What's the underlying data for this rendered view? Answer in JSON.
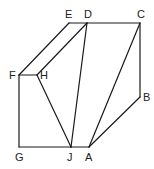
{
  "diagram": {
    "type": "geometric-figure",
    "stroke_color": "#1a1a1a",
    "label_color": "#222222",
    "vertices": [
      {
        "id": "E",
        "label": "E",
        "x": 69,
        "y": 23,
        "lx": 65,
        "ly": 18
      },
      {
        "id": "D",
        "label": "D",
        "x": 87,
        "y": 23,
        "lx": 84,
        "ly": 18
      },
      {
        "id": "C",
        "label": "C",
        "x": 140,
        "y": 23,
        "lx": 137,
        "ly": 18
      },
      {
        "id": "F",
        "label": "F",
        "x": 19,
        "y": 75,
        "lx": 9,
        "ly": 79
      },
      {
        "id": "H",
        "label": "H",
        "x": 37,
        "y": 75,
        "lx": 40,
        "ly": 79
      },
      {
        "id": "B",
        "label": "B",
        "x": 140,
        "y": 97,
        "lx": 143,
        "ly": 101
      },
      {
        "id": "G",
        "label": "G",
        "x": 19,
        "y": 147,
        "lx": 15,
        "ly": 161
      },
      {
        "id": "J",
        "label": "J",
        "x": 71,
        "y": 147,
        "lx": 67,
        "ly": 161
      },
      {
        "id": "A",
        "label": "A",
        "x": 89,
        "y": 147,
        "lx": 85,
        "ly": 161
      }
    ],
    "edges": [
      [
        "E",
        "D"
      ],
      [
        "D",
        "C"
      ],
      [
        "E",
        "F"
      ],
      [
        "D",
        "H"
      ],
      [
        "F",
        "H"
      ],
      [
        "F",
        "G"
      ],
      [
        "G",
        "J"
      ],
      [
        "J",
        "A"
      ],
      [
        "H",
        "J"
      ],
      [
        "D",
        "J"
      ],
      [
        "C",
        "A"
      ],
      [
        "C",
        "B"
      ],
      [
        "B",
        "A"
      ]
    ]
  }
}
